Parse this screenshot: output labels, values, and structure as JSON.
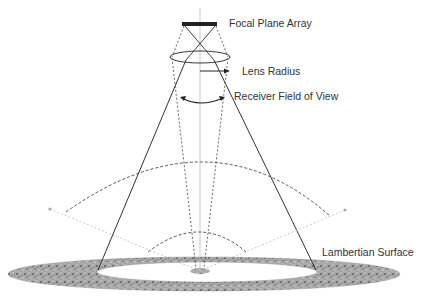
{
  "diagram": {
    "labels": {
      "focal_plane_array": "Focal Plane Array",
      "lens_radius": "Lens Radius",
      "receiver_fov": "Receiver Field of View",
      "lambertian_surface": "Lambertian Surface"
    },
    "colors": {
      "line": "#333333",
      "dashed": "#444444",
      "surface": "#9a9a9a",
      "axis": "#bbbbbb"
    }
  }
}
